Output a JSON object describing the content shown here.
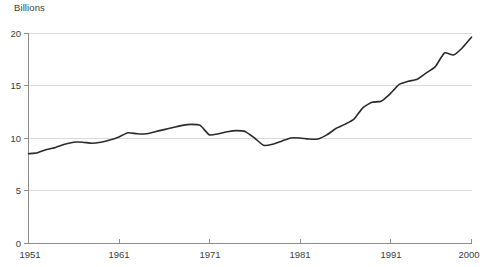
{
  "chart_data": {
    "type": "line",
    "title": "",
    "ylabel": "Billions",
    "xlabel": "",
    "ylim": [
      0,
      20
    ],
    "xlim": [
      1951,
      2000
    ],
    "yticks": [
      0,
      5,
      10,
      15,
      20
    ],
    "ytick_labels": [
      "0",
      "5",
      "10",
      "15",
      "20"
    ],
    "xticks": [
      1951,
      1961,
      1971,
      1981,
      1991,
      2000
    ],
    "xtick_labels": [
      "1951",
      "1961",
      "1971",
      "1981",
      "1991",
      "2000"
    ],
    "grid": "horizontal",
    "legend": "none",
    "line_color": "#2b2b2b",
    "grid_color": "#d9d9d9",
    "axis_color": "#8c8c8c",
    "x": [
      1951,
      1952,
      1953,
      1954,
      1955,
      1956,
      1957,
      1958,
      1959,
      1960,
      1961,
      1962,
      1963,
      1964,
      1965,
      1966,
      1967,
      1968,
      1969,
      1970,
      1971,
      1972,
      1973,
      1974,
      1975,
      1976,
      1977,
      1978,
      1979,
      1980,
      1981,
      1982,
      1983,
      1984,
      1985,
      1986,
      1987,
      1988,
      1989,
      1990,
      1991,
      1992,
      1993,
      1994,
      1995,
      1996,
      1997,
      1998,
      1999,
      2000
    ],
    "values": [
      8.5,
      8.6,
      8.9,
      9.1,
      9.4,
      9.6,
      9.6,
      9.5,
      9.6,
      9.8,
      10.1,
      10.5,
      10.4,
      10.4,
      10.6,
      10.8,
      11.0,
      11.2,
      11.3,
      11.2,
      10.3,
      10.4,
      10.6,
      10.7,
      10.6,
      10.0,
      9.3,
      9.4,
      9.7,
      10.0,
      10.0,
      9.9,
      9.9,
      10.3,
      10.9,
      11.3,
      11.8,
      12.9,
      13.4,
      13.5,
      14.2,
      15.1,
      15.4,
      15.6,
      16.2,
      16.8,
      18.1,
      17.9,
      18.6,
      19.6
    ]
  }
}
